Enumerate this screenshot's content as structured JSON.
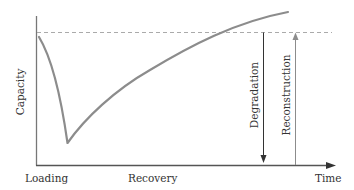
{
  "diagram": {
    "type": "capacity-time schematic",
    "y_axis": {
      "label": "Capacity"
    },
    "x_axis": {
      "label": "Time",
      "phase_labels": [
        "Loading",
        "Recovery"
      ]
    },
    "reference_line": {
      "style": "dashed",
      "meaning": "initial capacity level"
    },
    "curve": {
      "description": "Capacity drops sharply during loading to a minimum, then recovers gradually, eventually exceeding the initial level",
      "color": "#8c8c8c"
    },
    "arrows": [
      {
        "label": "Degradation",
        "direction": "down",
        "color": "#333333"
      },
      {
        "label": "Reconstruction",
        "direction": "up",
        "color": "#8c8c8c"
      }
    ],
    "colors": {
      "axis": "#555555",
      "dashed": "#aaaaaa",
      "curve": "#8c8c8c",
      "text": "#333333"
    }
  }
}
